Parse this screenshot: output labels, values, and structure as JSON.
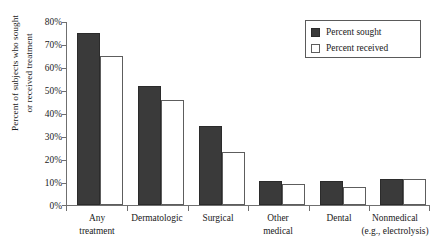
{
  "chart_data": {
    "type": "bar",
    "title": "",
    "xlabel": "",
    "ylabel": "Percent of subjects who sought or received treatment",
    "ylabel_lines": [
      "Percent of subjects who sought",
      "or received treatment"
    ],
    "categories": [
      "Any treatment",
      "Dermatologic",
      "Surgical",
      "Other medical",
      "Dental",
      "Nonmedical (e.g., electrolysis)"
    ],
    "category_lines": [
      [
        "Any",
        "treatment"
      ],
      [
        "Dermatologic"
      ],
      [
        "Surgical"
      ],
      [
        "Other",
        "medical"
      ],
      [
        "Dental"
      ],
      [
        "Nonmedical",
        "(e.g., electrolysis)"
      ]
    ],
    "series": [
      {
        "name": "Percent sought",
        "color": "#3a3a3a",
        "values": [
          75,
          52,
          34.5,
          10.5,
          10.5,
          11.5
        ]
      },
      {
        "name": "Percent received",
        "color": "#ffffff",
        "values": [
          65,
          46,
          23,
          9,
          8,
          11.5
        ]
      }
    ],
    "ylim": [
      0,
      80
    ],
    "ytick_values": [
      0,
      10,
      20,
      30,
      40,
      50,
      60,
      70,
      80
    ],
    "ytick_labels": [
      "0%",
      "10%",
      "20%",
      "30%",
      "40%",
      "50%",
      "60%",
      "70%",
      "80%"
    ],
    "grid": false,
    "legend_position": "top-right"
  },
  "legend": {
    "entries": [
      {
        "label": "Percent sought",
        "style": "sought"
      },
      {
        "label": "Percent received",
        "style": "received"
      }
    ]
  },
  "colors": {
    "sought_fill": "#3a3a3a",
    "received_fill": "#ffffff",
    "axis": "#6f6f6f",
    "text": "#1a1a1a",
    "background": "#ffffff"
  }
}
